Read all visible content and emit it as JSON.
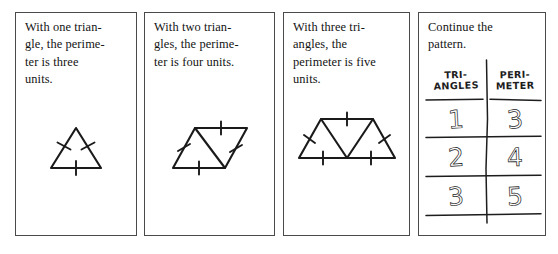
{
  "worksheet": {
    "panels": [
      {
        "id": "panel-1",
        "prompt": "With one trian-\ngle, the perime-\nter is three\nunits.",
        "figure_name": "one-triangle-figure",
        "triangles": 1,
        "perimeter_units": 3
      },
      {
        "id": "panel-2",
        "prompt": "With two trian-\ngles, the perime-\nter is four units.",
        "figure_name": "two-triangles-rhombus-figure",
        "triangles": 2,
        "perimeter_units": 4
      },
      {
        "id": "panel-3",
        "prompt": "With three tri-\nangles, the\nperimeter is five\nunits.",
        "figure_name": "three-triangles-trapezoid-figure",
        "triangles": 3,
        "perimeter_units": 5
      },
      {
        "id": "panel-4",
        "prompt": "Continue the\npattern.",
        "figure_name": "pattern-table"
      }
    ]
  },
  "table": {
    "headers": [
      "TRI-\nANGLES",
      "PERI-\nMETER"
    ],
    "rows": [
      [
        "1",
        "3"
      ],
      [
        "2",
        "4"
      ],
      [
        "3",
        "5"
      ],
      [
        "",
        ""
      ]
    ]
  },
  "colors": {
    "ink": "#1a1a1a",
    "panel_border": "#4a4a4a",
    "background": "#ffffff"
  }
}
